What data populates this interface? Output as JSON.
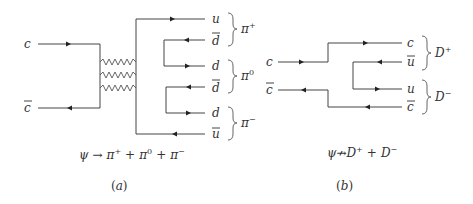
{
  "panel_a": {
    "incoming": [
      {
        "label": "c",
        "overline": false,
        "direction": "right"
      },
      {
        "label": "c",
        "overline": true,
        "direction": "left"
      }
    ],
    "gluons": 3,
    "outgoing": [
      {
        "label": "u",
        "overline": false
      },
      {
        "label": "d",
        "overline": true
      },
      {
        "label": "d",
        "overline": false
      },
      {
        "label": "d",
        "overline": true
      },
      {
        "label": "d",
        "overline": false
      },
      {
        "label": "u",
        "overline": true
      }
    ],
    "mesons": [
      {
        "base": "π",
        "charge": "+"
      },
      {
        "base": "π",
        "charge": "0"
      },
      {
        "base": "π",
        "charge": "−"
      }
    ],
    "caption": {
      "psi": "ψ",
      "arrow": "→",
      "t1": "π",
      "s1": "+",
      "plus1": "+",
      "t2": "π",
      "s2": "0",
      "plus2": "+",
      "t3": "π",
      "s3": "−"
    },
    "tag": "(a)"
  },
  "panel_b": {
    "incoming": [
      {
        "label": "c",
        "overline": false,
        "direction": "right"
      },
      {
        "label": "c",
        "overline": true,
        "direction": "left"
      }
    ],
    "outgoing": [
      {
        "label": "c",
        "overline": false
      },
      {
        "label": "u",
        "overline": true
      },
      {
        "label": "u",
        "overline": false
      },
      {
        "label": "c",
        "overline": true
      }
    ],
    "mesons": [
      {
        "base": "D",
        "charge": "+"
      },
      {
        "base": "D",
        "charge": "−"
      }
    ],
    "caption": {
      "psi": "ψ",
      "arrow": "↛",
      "t1": "D",
      "s1": "+",
      "plus1": "+",
      "t2": "D",
      "s2": "−"
    },
    "tag": "(b)"
  }
}
